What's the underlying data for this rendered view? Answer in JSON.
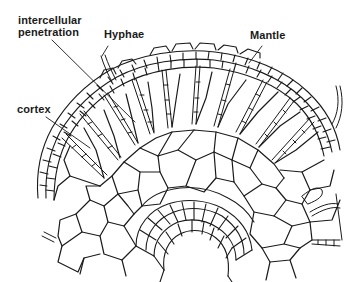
{
  "diagram": {
    "type": "root cross-section with ectomycorrhizal fungal mantle",
    "labels": {
      "intercellular_line1": "intercellular",
      "intercellular_line2": "penetration",
      "hyphae": "Hyphae",
      "mantle": "Mantle",
      "cortex": "cortex"
    },
    "colors": {
      "ink": "#1a1a1a",
      "background": "#ffffff"
    }
  }
}
